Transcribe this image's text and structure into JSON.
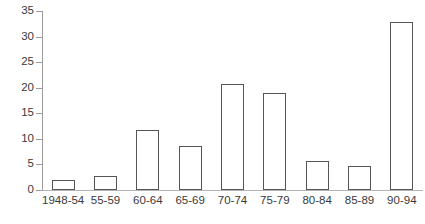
{
  "chart_data": {
    "type": "bar",
    "title": "",
    "subtitle": "",
    "xlabel": "",
    "ylabel": "",
    "categories": [
      "1948-54",
      "55-59",
      "60-64",
      "65-69",
      "70-74",
      "75-79",
      "80-84",
      "85-89",
      "90-94"
    ],
    "values": [
      2.0,
      2.7,
      11.7,
      8.7,
      20.7,
      19.0,
      5.6,
      4.6,
      32.8
    ],
    "ylim": [
      0,
      35
    ],
    "yticks": [
      0,
      5,
      10,
      15,
      20,
      25,
      30,
      35
    ],
    "ytick_labels": [
      "0",
      "5",
      "10",
      "15",
      "20",
      "25",
      "30",
      "35"
    ],
    "grid": false,
    "legend": "none",
    "series": [
      {
        "name": "count",
        "values": [
          2.0,
          2.7,
          11.7,
          8.7,
          20.7,
          19.0,
          5.6,
          4.6,
          32.8
        ]
      }
    ],
    "style": {
      "bar_fill": "#ffffff",
      "bar_stroke": "#555555",
      "axis_color": "#9a9a9a",
      "text_color": "#3a3a3a",
      "background": "#ffffff"
    }
  }
}
